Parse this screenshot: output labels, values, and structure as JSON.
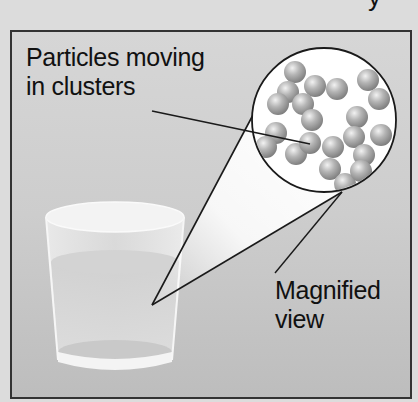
{
  "title_fragment": "y",
  "diagram": {
    "labels": {
      "particles_line1": "Particles moving",
      "particles_line2": "in clusters",
      "magnified_line1": "Magnified",
      "magnified_line2": "view"
    },
    "colors": {
      "background": "#dcdcdc",
      "panel_top": "#d6d6d6",
      "panel_bottom": "#bdbdbd",
      "outline": "#1a1a1a",
      "particle": "#9a9a9a",
      "magnifier_fill": "#ffffff"
    },
    "magnifier": {
      "cx": 324,
      "cy": 120,
      "r": 72
    },
    "cone_apex": {
      "x": 152,
      "y": 305
    },
    "particle_count": 21
  }
}
